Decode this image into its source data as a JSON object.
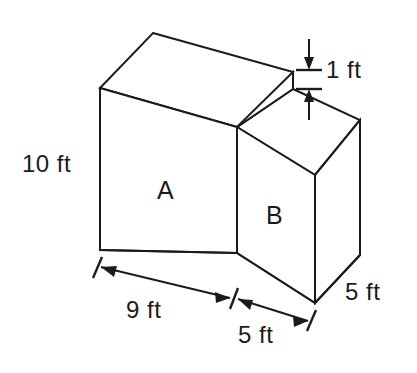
{
  "figure": {
    "units": "ft",
    "line_color": "#1b1b1b",
    "background_color": "#ffffff",
    "faces": [
      {
        "name": "prism-a",
        "label": "A"
      },
      {
        "name": "prism-b",
        "label": "B"
      }
    ],
    "dimensions": [
      {
        "name": "height-left",
        "label": "10 ft",
        "value": 10,
        "unit": "ft",
        "applies_to": "A",
        "orientation": "vertical"
      },
      {
        "name": "step-height",
        "label": "1 ft",
        "value": 1,
        "unit": "ft",
        "applies_to": "step between A and B tops",
        "orientation": "vertical"
      },
      {
        "name": "width-a",
        "label": "9 ft",
        "value": 9,
        "unit": "ft",
        "applies_to": "A",
        "orientation": "horizontal"
      },
      {
        "name": "width-b",
        "label": "5 ft",
        "value": 5,
        "unit": "ft",
        "applies_to": "B",
        "orientation": "horizontal"
      },
      {
        "name": "depth",
        "label": "5 ft",
        "value": 5,
        "unit": "ft",
        "applies_to": "B",
        "orientation": "depth"
      }
    ]
  },
  "labels": {
    "height_left": "10 ft",
    "step_height": "1 ft",
    "width_a": "9 ft",
    "width_b": "5 ft",
    "depth_right": "5 ft",
    "prism_a": "A",
    "prism_b": "B"
  }
}
